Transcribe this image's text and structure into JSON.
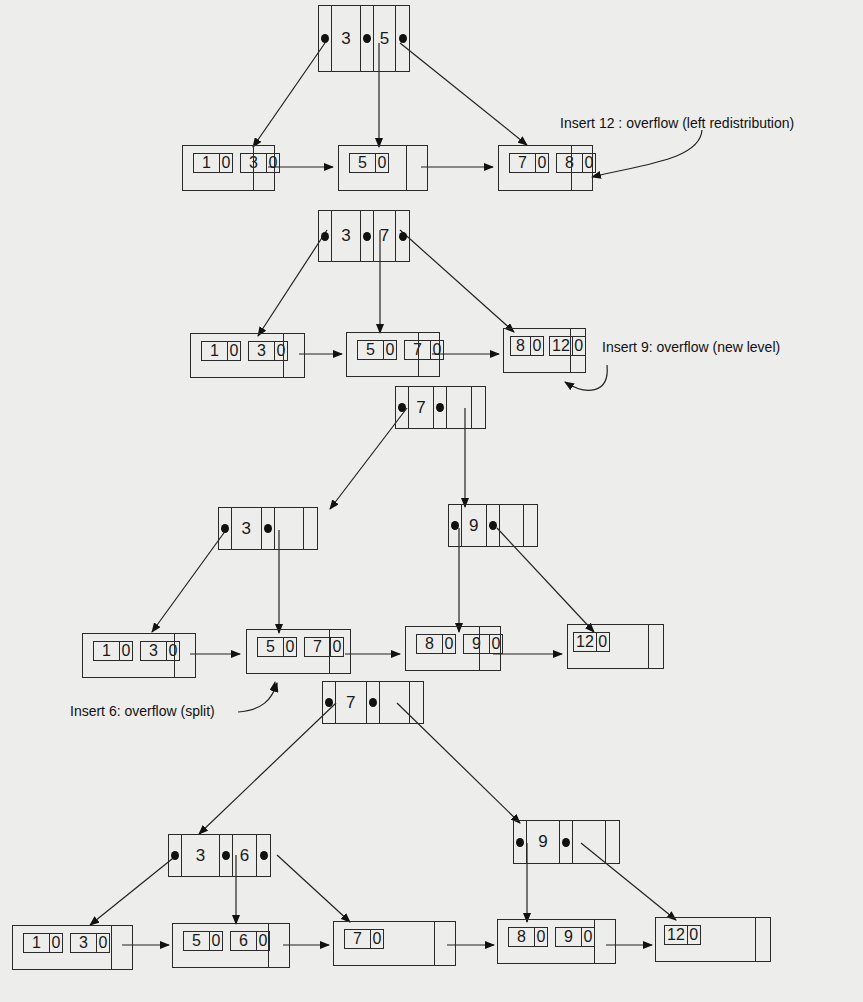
{
  "diagram": {
    "type": "B+ tree insertion sequence",
    "steps": [
      {
        "name": "tree-1",
        "root": {
          "keys": [
            "3",
            "5"
          ]
        },
        "leaves": [
          {
            "keys": [
              [
                "1",
                "0"
              ],
              [
                "3",
                "0"
              ]
            ]
          },
          {
            "keys": [
              [
                "5",
                "0"
              ]
            ]
          },
          {
            "keys": [
              [
                "7",
                "0"
              ],
              [
                "8",
                "0"
              ]
            ]
          }
        ],
        "annotation": "Insert 12 : overflow (left redistribution)"
      },
      {
        "name": "tree-2",
        "root": {
          "keys": [
            "3",
            "7"
          ]
        },
        "leaves": [
          {
            "keys": [
              [
                "1",
                "0"
              ],
              [
                "3",
                "0"
              ]
            ]
          },
          {
            "keys": [
              [
                "5",
                "0"
              ],
              [
                "7",
                "0"
              ]
            ]
          },
          {
            "keys": [
              [
                "8",
                "0"
              ],
              [
                "12",
                "0"
              ]
            ]
          }
        ],
        "annotation": "Insert 9: overflow (new level)"
      },
      {
        "name": "tree-3",
        "root": {
          "keys": [
            "7"
          ]
        },
        "internal": [
          {
            "keys": [
              "3"
            ]
          },
          {
            "keys": [
              "9"
            ]
          }
        ],
        "leaves": [
          {
            "keys": [
              [
                "1",
                "0"
              ],
              [
                "3",
                "0"
              ]
            ]
          },
          {
            "keys": [
              [
                "5",
                "0"
              ],
              [
                "7",
                "0"
              ]
            ]
          },
          {
            "keys": [
              [
                "8",
                "0"
              ],
              [
                "9",
                "0"
              ]
            ]
          },
          {
            "keys": [
              [
                "12",
                "0"
              ]
            ]
          }
        ],
        "annotation": "Insert 6: overflow (split)"
      },
      {
        "name": "tree-4",
        "root": {
          "keys": [
            "7"
          ]
        },
        "internal": [
          {
            "keys": [
              "3",
              "6"
            ]
          },
          {
            "keys": [
              "9"
            ]
          }
        ],
        "leaves": [
          {
            "keys": [
              [
                "1",
                "0"
              ],
              [
                "3",
                "0"
              ]
            ]
          },
          {
            "keys": [
              [
                "5",
                "0"
              ],
              [
                "6",
                "0"
              ]
            ]
          },
          {
            "keys": [
              [
                "7",
                "0"
              ]
            ]
          },
          {
            "keys": [
              [
                "8",
                "0"
              ],
              [
                "9",
                "0"
              ]
            ]
          },
          {
            "keys": [
              [
                "12",
                "0"
              ]
            ]
          }
        ]
      }
    ]
  },
  "colors": {
    "ink": "#1a1a1a",
    "paper": "#ededeb"
  }
}
